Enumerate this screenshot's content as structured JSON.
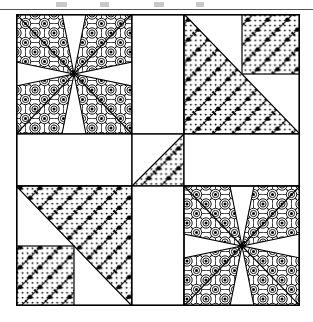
{
  "page": {
    "kind": "quilt-block-diagram",
    "background_color": "#ffffff",
    "ink_color": "#000000",
    "width": 313,
    "height": 322
  },
  "header_rule": {
    "present": true,
    "color": "#555555",
    "y": 9,
    "thickness": 1
  },
  "ghost_text_marks": [
    {
      "x": 56,
      "width": 11
    },
    {
      "x": 100,
      "width": 9
    },
    {
      "x": 154,
      "width": 10
    },
    {
      "x": 196,
      "width": 8
    }
  ],
  "quilt": {
    "outer_border_color": "#000000",
    "outer_border_width": 1.6,
    "seam_color": "#000000",
    "seam_width": 1.2,
    "fabrics": {
      "background": {
        "name": "plain-white",
        "color": "#ffffff"
      },
      "floral": {
        "name": "dense-floral-medallion-print",
        "color": "#000000"
      },
      "dotted": {
        "name": "diagonal-dot-print",
        "color": "#000000"
      }
    },
    "grid": {
      "rows": 3,
      "cols": 3,
      "col_fractions": [
        0.41,
        0.18,
        0.41
      ],
      "row_fractions": [
        0.41,
        0.18,
        0.41
      ]
    },
    "cells": [
      {
        "name": "top-left-block",
        "row": 0,
        "col": 0,
        "pattern": "x-cross-star",
        "fabric": "floral",
        "description": "Four floral triangles forming an X meeting at the block center"
      },
      {
        "name": "top-center-block",
        "row": 0,
        "col": 1,
        "pattern": "plain",
        "fabric": "background",
        "description": "Plain white vertical rectangle"
      },
      {
        "name": "top-right-block",
        "row": 0,
        "col": 2,
        "pattern": "big-triangle-with-corner-square",
        "fabric": "dotted",
        "triangle_corner": "bottom-left",
        "corner_square_position": "top-right",
        "corner_square_fabric": "dotted",
        "description": "Large dotted lower-left triangle plus a small dotted square in the upper-right corner"
      },
      {
        "name": "middle-left-block",
        "row": 1,
        "col": 0,
        "pattern": "plain",
        "fabric": "background",
        "description": "Plain white horizontal rectangle"
      },
      {
        "name": "center-block",
        "row": 1,
        "col": 1,
        "pattern": "half-square-triangle",
        "fabric": "dotted",
        "triangle_corner": "bottom-right",
        "description": "Small square split on the diagonal; lower-right half dotted, upper-left half white"
      },
      {
        "name": "middle-right-block",
        "row": 1,
        "col": 2,
        "pattern": "plain",
        "fabric": "background",
        "description": "Plain white horizontal rectangle"
      },
      {
        "name": "bottom-left-block",
        "row": 2,
        "col": 0,
        "pattern": "big-triangle-with-corner-square",
        "fabric": "dotted",
        "triangle_corner": "top-right",
        "corner_square_position": "bottom-left",
        "corner_square_fabric": "dotted",
        "description": "Large dotted upper-right triangle plus a small dotted square in the lower-left corner"
      },
      {
        "name": "bottom-center-block",
        "row": 2,
        "col": 1,
        "pattern": "plain",
        "fabric": "background",
        "description": "Plain white vertical rectangle"
      },
      {
        "name": "bottom-right-block",
        "row": 2,
        "col": 2,
        "pattern": "x-cross-star",
        "fabric": "floral",
        "description": "Four floral triangles forming an X meeting at the block center"
      }
    ]
  }
}
